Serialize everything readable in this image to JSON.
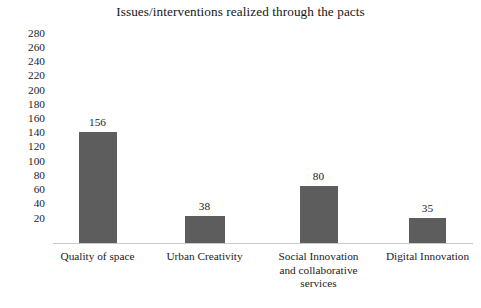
{
  "chart_data": {
    "type": "bar",
    "title": "Issues/interventions realized through the pacts",
    "xlabel": "",
    "ylabel": "",
    "categories": [
      "Quality of space",
      "Urban Creativity",
      "Social Innovation and collaborative services",
      "Digital Innovation"
    ],
    "category_lines": [
      [
        "Quality of space"
      ],
      [
        "Urban Creativity"
      ],
      [
        "Social Innovation",
        "and collaborative",
        "services"
      ],
      [
        "Digital Innovation"
      ]
    ],
    "values": [
      156,
      38,
      80,
      35
    ],
    "value_labels": [
      "156",
      "38",
      "80",
      "35"
    ],
    "ylim": [
      0,
      290
    ],
    "yticks": [
      20,
      40,
      60,
      80,
      100,
      120,
      140,
      160,
      180,
      200,
      220,
      240,
      260,
      280
    ],
    "ytick_labels": [
      "20",
      "40",
      "60",
      "80",
      "100",
      "120",
      "140",
      "160",
      "180",
      "200",
      "220",
      "240",
      "260",
      "280"
    ],
    "grid": false,
    "legend": null,
    "legend_position": "none",
    "bar_color": "#5d5d5d",
    "axis_color": "#c8c8c8",
    "background": "#ffffff"
  }
}
